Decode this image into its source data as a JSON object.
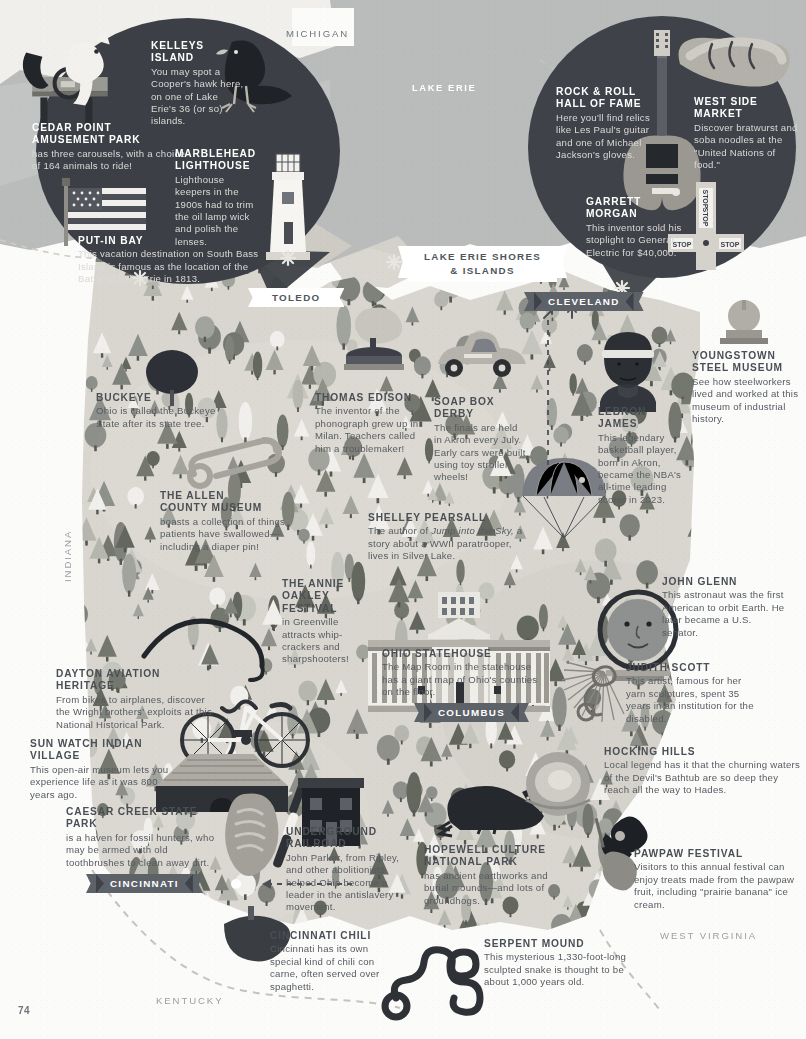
{
  "page": {
    "number": "74"
  },
  "lake": {
    "label": "LAKE ERIE"
  },
  "neighbors": [
    {
      "name": "MICHIGAN"
    },
    {
      "name": "INDIANA"
    },
    {
      "name": "KENTUCKY"
    },
    {
      "name": "WEST VIRGINIA"
    }
  ],
  "banners": [
    {
      "id": "lake-erie-shores",
      "line1": "LAKE ERIE SHORES",
      "line2": "& ISLANDS",
      "style": "white"
    },
    {
      "id": "toledo",
      "label": "TOLEDO",
      "style": "white"
    },
    {
      "id": "cleveland",
      "label": "CLEVELAND",
      "style": "dark"
    },
    {
      "id": "columbus",
      "label": "COLUMBUS",
      "style": "dark"
    },
    {
      "id": "cincinnati",
      "label": "CINCINNATI",
      "style": "dark"
    }
  ],
  "bubble_left": {
    "entries": [
      {
        "id": "kelleys-island",
        "title": "KELLEYS\nISLAND",
        "title_lines": [
          "KELLEYS",
          "ISLAND"
        ],
        "body": "You may spot a Cooper's hawk here, on one of Lake Erie's 36 (or so) islands."
      },
      {
        "id": "cedar-point",
        "title_lines": [
          "CEDAR POINT",
          "AMUSEMENT PARK"
        ],
        "body": "has three carousels, with a choice of 164 animals to ride!"
      },
      {
        "id": "marblehead-lighthouse",
        "title_lines": [
          "MARBLEHEAD",
          "LIGHTHOUSE"
        ],
        "body": "Lighthouse keepers in the 1900s had to trim the oil lamp wick and polish the lenses."
      },
      {
        "id": "put-in-bay",
        "title_lines": [
          "PUT-IN BAY"
        ],
        "body": "This vacation destination on South Bass Island is famous as the location of the Battle of Lake Erie in 1813."
      }
    ]
  },
  "bubble_right": {
    "entries": [
      {
        "id": "rock-and-roll-hall-of-fame",
        "title_lines": [
          "ROCK & ROLL",
          "HALL OF FAME"
        ],
        "body": "Here you'll find relics like Les Paul's guitar and one of Michael Jackson's gloves."
      },
      {
        "id": "west-side-market",
        "title_lines": [
          "WEST SIDE",
          "MARKET"
        ],
        "body": "Discover bratwurst and soba noodles at the \"United Nations of food.\""
      },
      {
        "id": "garrett-morgan",
        "title_lines": [
          "GARRETT MORGAN"
        ],
        "body": "This inventor sold his stoplight to General Electric for $40,000."
      }
    ]
  },
  "map_entries": [
    {
      "id": "buckeye",
      "title_lines": [
        "BUCKEYE"
      ],
      "body": "Ohio is called the Buckeye State after its state tree."
    },
    {
      "id": "thomas-edison",
      "title_lines": [
        "THOMAS EDISON"
      ],
      "body": "The inventor of the phonograph grew up in Milan. Teachers called him a troublemaker!"
    },
    {
      "id": "soap-box-derby",
      "title_lines": [
        "SOAP BOX DERBY"
      ],
      "body": "The finals are held in Akron every July. Early cars were built using toy stroller wheels!"
    },
    {
      "id": "lebron-james",
      "title_lines": [
        "LeBRON JAMES"
      ],
      "body": "This legendary basketball player, born in Akron, became the NBA's all-time leading scorer in 2023."
    },
    {
      "id": "youngstown-steel-museum",
      "title_lines": [
        "YOUNGSTOWN",
        "STEEL MUSEUM"
      ],
      "body": "See how steelworkers lived and worked at this museum of industrial history."
    },
    {
      "id": "allen-county-museum",
      "title_lines": [
        "THE ALLEN",
        "COUNTY MUSEUM"
      ],
      "body": "boasts a collection of things patients have swallowed—including a diaper pin!"
    },
    {
      "id": "shelley-pearsall",
      "title_lines": [
        "SHELLEY PEARSALL"
      ],
      "body_pre": "The author of ",
      "body_italic": "Jump into the Sky,",
      "body_post": " a story about a WWII paratrooper, lives in Silver Lake."
    },
    {
      "id": "annie-oakley-festival",
      "title_lines": [
        "THE ANNIE",
        "OAKLEY",
        "FESTIVAL"
      ],
      "body": "in Greenville attracts whip-crackers and sharpshooters!"
    },
    {
      "id": "ohio-statehouse",
      "title_lines": [
        "OHIO STATEHOUSE"
      ],
      "body": "The Map Room in the statehouse has a giant map of Ohio's counties on the floor."
    },
    {
      "id": "john-glenn",
      "title_lines": [
        "JOHN GLENN"
      ],
      "body": "This astronaut was the first American to orbit Earth. He later became a U.S. senator."
    },
    {
      "id": "judith-scott",
      "title_lines": [
        "JUDITH SCOTT"
      ],
      "body": "This artist, famous for her yarn sculptures, spent 35 years in an institution for the disabled."
    },
    {
      "id": "dayton-aviation-heritage",
      "title_lines": [
        "DAYTON AVIATION HERITAGE"
      ],
      "body": "From bikes to airplanes, discover the Wright brothers' exploits at this National Historical Park."
    },
    {
      "id": "sun-watch-indian-village",
      "title_lines": [
        "SUN WATCH INDIAN VILLAGE"
      ],
      "body": "This open-air museum lets you experience life as it was 800 years ago."
    },
    {
      "id": "caesar-creek-state-park",
      "title_lines": [
        "CAESAR CREEK STATE PARK"
      ],
      "body": "is a haven for fossil hunters, who may be armed with old toothbrushes to clean away dirt."
    },
    {
      "id": "hocking-hills",
      "title_lines": [
        "HOCKING HILLS"
      ],
      "body": "Local legend has it that the churning waters of the Devil's Bathtub are so deep they reach all the way to Hades."
    },
    {
      "id": "underground-railroad",
      "title_lines": [
        "UNDERGROUND",
        "RAILROAD"
      ],
      "body": "John Parker, from Ripley, and other abolitionists helped Ohio become a leader in the antislavery movement."
    },
    {
      "id": "hopewell-culture-national-park",
      "title_lines": [
        "HOPEWELL CULTURE",
        "NATIONAL PARK"
      ],
      "body": "has ancient earthworks and burial mounds—and lots of groundhogs."
    },
    {
      "id": "pawpaw-festival",
      "title_lines": [
        "PAWPAW FESTIVAL"
      ],
      "body": "Visitors to this annual festival can enjoy treats made from the pawpaw fruit, including \"prairie banana\" ice cream."
    },
    {
      "id": "cincinnati-chili",
      "title_lines": [
        "CINCINNATI CHILI"
      ],
      "body": "Cincinnati has its own special kind of chili con carne, often served over spaghetti."
    },
    {
      "id": "serpent-mound",
      "title_lines": [
        "SERPENT MOUND"
      ],
      "body": "This mysterious 1,330-foot-long sculpted snake is thought to be about 1,000 years old."
    }
  ],
  "icons": [
    {
      "name": "carousel-horse-icon"
    },
    {
      "name": "coopers-hawk-icon"
    },
    {
      "name": "american-flag-icon"
    },
    {
      "name": "lighthouse-icon"
    },
    {
      "name": "electric-guitar-icon"
    },
    {
      "name": "bratwurst-hotdog-icon"
    },
    {
      "name": "traffic-stoplight-icon"
    },
    {
      "name": "phonograph-icon"
    },
    {
      "name": "soap-box-derby-car-icon"
    },
    {
      "name": "buckeye-leaf-icon"
    },
    {
      "name": "safety-pin-icon"
    },
    {
      "name": "whip-icon"
    },
    {
      "name": "parachute-icon"
    },
    {
      "name": "lebron-james-portrait-icon"
    },
    {
      "name": "steel-mill-icon"
    },
    {
      "name": "statehouse-building-icon"
    },
    {
      "name": "astronaut-helmet-icon"
    },
    {
      "name": "yarn-sculpture-icon"
    },
    {
      "name": "bicycle-icon"
    },
    {
      "name": "longhouse-icon"
    },
    {
      "name": "fossil-icon"
    },
    {
      "name": "toothbrush-icon"
    },
    {
      "name": "brick-house-icon"
    },
    {
      "name": "groundhog-icon"
    },
    {
      "name": "hocking-hills-rock-icon"
    },
    {
      "name": "pawpaw-fruit-icon"
    },
    {
      "name": "chili-bowl-icon"
    },
    {
      "name": "serpent-mound-icon"
    }
  ],
  "colors": {
    "map_land": "#d9d6cf",
    "lake_water": "#b9bcbb",
    "bubble_dark": "#3c4046",
    "banner_dark": "#5d6168",
    "heading_text": "#4a4f55",
    "body_text": "#565b61",
    "page_bg": "#fbfbfa"
  }
}
